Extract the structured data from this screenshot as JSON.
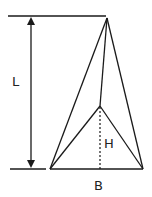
{
  "diagram": {
    "labels": {
      "length": "L",
      "height": "H",
      "base": "B"
    },
    "colors": {
      "line": "#1a1a1a",
      "background": "#ffffff"
    }
  }
}
